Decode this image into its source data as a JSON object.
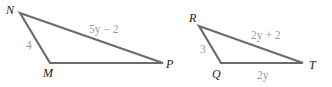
{
  "figure": {
    "triangles": [
      {
        "id": "NMP",
        "vertices": {
          "N": {
            "label": "N",
            "x": 20,
            "y": 13
          },
          "M": {
            "label": "M",
            "x": 50,
            "y": 63
          },
          "P": {
            "label": "P",
            "x": 163,
            "y": 63
          }
        },
        "sides": {
          "NM": "4",
          "NP": "5y − 2",
          "MP": ""
        }
      },
      {
        "id": "RQT",
        "vertices": {
          "R": {
            "label": "R",
            "x": 199,
            "y": 26
          },
          "Q": {
            "label": "Q",
            "x": 221,
            "y": 63
          },
          "T": {
            "label": "T",
            "x": 303,
            "y": 63
          }
        },
        "sides": {
          "RQ": "3",
          "RT": "2y + 2",
          "QT": "2y"
        }
      }
    ],
    "colors": {
      "edge": "#6b6b6b",
      "vertex_label": "#1a1a1a",
      "side_label": "#9a9a9a"
    }
  }
}
